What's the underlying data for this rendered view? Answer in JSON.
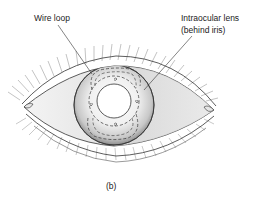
{
  "figure": {
    "caption": "(b)",
    "labels": {
      "wire_loop": "Wire loop",
      "intraocular_lens_line1": "Intraocular lens",
      "intraocular_lens_line2": "(behind iris)"
    },
    "colors": {
      "line": "#333333",
      "sclera_shade": "#d9d9d9",
      "iris_light": "#f4f4f4",
      "iris_dark": "#9a9a9a",
      "background": "#ffffff"
    }
  }
}
